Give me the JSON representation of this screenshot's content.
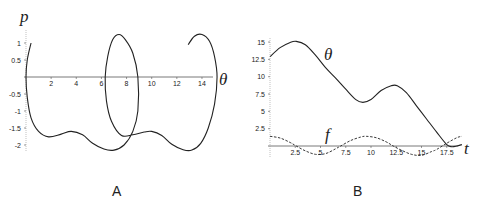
{
  "chart_data": [
    {
      "panel": "A",
      "type": "line",
      "title": "",
      "xlabel": "θ",
      "ylabel": "p",
      "xticks": [
        "2",
        "4",
        "6",
        "8",
        "10",
        "12",
        "14"
      ],
      "yticks": [
        "1",
        "0.5",
        "-0.5",
        "-1",
        "-1.5",
        "-2"
      ],
      "xlim": [
        0,
        15.2
      ],
      "ylim": [
        -2.2,
        1.3
      ],
      "grid": false,
      "series": [
        {
          "name": "phase trajectory",
          "style": "solid",
          "x": [
            0.4,
            0.1,
            0.0,
            0.1,
            0.4,
            1.0,
            1.8,
            2.8,
            3.6,
            4.5,
            5.3,
            6.2,
            7.0,
            7.8,
            8.5,
            8.9,
            8.9,
            8.5,
            7.9,
            7.4,
            6.9,
            6.5,
            6.3,
            6.4,
            6.8,
            7.6,
            8.5,
            9.4,
            10.0,
            10.8,
            11.6,
            12.5,
            13.2,
            13.9,
            14.5,
            15.0,
            15.2,
            15.0,
            14.6,
            14.0,
            13.4,
            12.9
          ],
          "y": [
            1.0,
            0.5,
            0.0,
            -0.6,
            -1.2,
            -1.6,
            -1.76,
            -1.68,
            -1.6,
            -1.7,
            -1.95,
            -2.12,
            -2.15,
            -2.0,
            -1.6,
            -1.0,
            0.0,
            0.7,
            1.1,
            1.25,
            1.1,
            0.6,
            0.0,
            -0.7,
            -1.3,
            -1.72,
            -1.7,
            -1.62,
            -1.6,
            -1.72,
            -1.98,
            -2.14,
            -2.15,
            -1.95,
            -1.5,
            -0.8,
            0.0,
            0.6,
            1.05,
            1.25,
            1.2,
            0.95
          ]
        }
      ]
    },
    {
      "panel": "B",
      "type": "line",
      "title": "",
      "xlabel": "t",
      "ylabel": "",
      "xticks": [
        "2.5",
        "5",
        "7.5",
        "10",
        "12.5",
        "15",
        "17.5"
      ],
      "yticks": [
        "15",
        "12.5",
        "10",
        "7.5",
        "5",
        "2.5"
      ],
      "xlim": [
        0,
        19
      ],
      "ylim": [
        -0.8,
        15.5
      ],
      "grid": false,
      "series": [
        {
          "name": "θ",
          "style": "solid",
          "x": [
            0,
            1,
            2,
            2.6,
            3.5,
            4.5,
            5.5,
            6.5,
            7.5,
            8.5,
            9.2,
            10,
            11,
            12,
            12.6,
            13.5,
            14.5,
            15.5,
            16.5,
            17.5,
            18,
            18.5,
            19
          ],
          "y": [
            12.9,
            14.2,
            14.95,
            15.1,
            14.6,
            13.1,
            11.3,
            9.8,
            8.2,
            6.7,
            6.3,
            6.7,
            8.0,
            8.7,
            8.7,
            7.7,
            5.8,
            3.9,
            2.0,
            0.2,
            -0.1,
            0.0,
            0.2
          ]
        },
        {
          "name": "f",
          "style": "dashed",
          "x": [
            0,
            1,
            2,
            2.6,
            3.5,
            4.5,
            5.5,
            6.5,
            7,
            8,
            9,
            9.5,
            10.5,
            11.5,
            12.2,
            13,
            14,
            15,
            16,
            16.5,
            17.5,
            18.5,
            19
          ],
          "y": [
            1.4,
            1.15,
            0.5,
            0.0,
            -0.7,
            -1.2,
            -1.1,
            -0.4,
            0.0,
            0.8,
            1.3,
            1.4,
            1.2,
            0.6,
            0.0,
            -0.6,
            -1.2,
            -1.35,
            -0.8,
            -0.5,
            0.4,
            1.2,
            1.4
          ]
        }
      ],
      "annotations": [
        {
          "text": "θ",
          "near": "upper curve"
        },
        {
          "text": "f",
          "near": "dashed curve"
        }
      ]
    }
  ],
  "panels": {
    "a": {
      "label": "A",
      "axis_x_label": "θ",
      "axis_y_label": "p",
      "xticks": [
        "2",
        "4",
        "6",
        "8",
        "10",
        "12",
        "14"
      ],
      "yticks": [
        "1",
        "0.5",
        "-0.5",
        "-1",
        "-1.5",
        "-2"
      ]
    },
    "b": {
      "label": "B",
      "axis_x_label": "t",
      "curve_theta_label": "θ",
      "curve_f_label": "f",
      "xticks": [
        "2.5",
        "5",
        "7.5",
        "10",
        "12.5",
        "15",
        "17.5"
      ],
      "yticks": [
        "15",
        "12.5",
        "10",
        "7.5",
        "5",
        "2.5"
      ]
    }
  }
}
